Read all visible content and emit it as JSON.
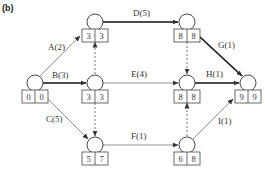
{
  "figure": {
    "label": "(b)"
  },
  "nodes": [
    {
      "id": "n0",
      "cx": 35,
      "cy": 83,
      "es": "0",
      "ls": "0"
    },
    {
      "id": "n1",
      "cx": 95,
      "cy": 22,
      "es": "3",
      "ls": "3"
    },
    {
      "id": "n2",
      "cx": 95,
      "cy": 83,
      "es": "3",
      "ls": "3"
    },
    {
      "id": "n3",
      "cx": 95,
      "cy": 145,
      "es": "5",
      "ls": "7"
    },
    {
      "id": "n4",
      "cx": 187,
      "cy": 22,
      "es": "8",
      "ls": "8"
    },
    {
      "id": "n5",
      "cx": 187,
      "cy": 83,
      "es": "8",
      "ls": "8"
    },
    {
      "id": "n6",
      "cx": 187,
      "cy": 145,
      "es": "6",
      "ls": "8"
    },
    {
      "id": "n7",
      "cx": 248,
      "cy": 83,
      "es": "9",
      "ls": "9"
    }
  ],
  "edges": [
    {
      "id": "A",
      "label": "A(2)",
      "from": "n0",
      "to": "n1",
      "style": "thin"
    },
    {
      "id": "B",
      "label": "B(3)",
      "from": "n0",
      "to": "n2",
      "style": "bold"
    },
    {
      "id": "C",
      "label": "C(5)",
      "from": "n0",
      "to": "n3",
      "style": "thin"
    },
    {
      "id": "D",
      "label": "D(5)",
      "from": "n1",
      "to": "n4",
      "style": "bold"
    },
    {
      "id": "E",
      "label": "E(4)",
      "from": "n2",
      "to": "n5",
      "style": "thin"
    },
    {
      "id": "F",
      "label": "F(1)",
      "from": "n3",
      "to": "n6",
      "style": "thin"
    },
    {
      "id": "G",
      "label": "G(1)",
      "from": "n4",
      "to": "n7",
      "style": "bold"
    },
    {
      "id": "H",
      "label": "H(1)",
      "from": "n5",
      "to": "n7",
      "style": "bold"
    },
    {
      "id": "I",
      "label": "I(1)",
      "from": "n6",
      "to": "n7",
      "style": "thin"
    },
    {
      "id": "d1",
      "label": "",
      "from": "n2",
      "to": "n1",
      "style": "dummy"
    },
    {
      "id": "d2",
      "label": "",
      "from": "n2",
      "to": "n3",
      "style": "dummy"
    },
    {
      "id": "d3",
      "label": "",
      "from": "n4",
      "to": "n5",
      "style": "dummy"
    },
    {
      "id": "d4",
      "label": "",
      "from": "n6",
      "to": "n5",
      "style": "dummy"
    }
  ],
  "colors": {
    "line": "#555555",
    "critical": "#111111",
    "box": "#444444"
  }
}
